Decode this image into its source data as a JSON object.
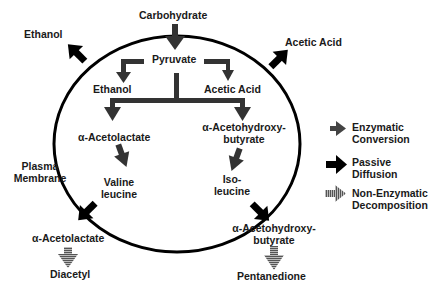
{
  "diagram": {
    "inputs": {
      "top": "Carbohydrate"
    },
    "inside_cell": {
      "pyruvate": "Pyruvate",
      "ethanol": "Ethanol",
      "acetic_acid": "Acetic Acid",
      "acetolactate": "α-Acetolactate",
      "acetohydroxy_line1": "α-Acetohydroxy-",
      "acetohydroxy_line2": "butyrate",
      "valine_line1": "Valine",
      "valine_line2": "leucine",
      "isoleucine_line1": "Iso-",
      "isoleucine_line2": "leucine"
    },
    "outside_cell": {
      "ethanol": "Ethanol",
      "acetic_acid": "Acetic Acid",
      "membrane_line1": "Plasma",
      "membrane_line2": "Membrane",
      "acetolactate": "α-Acetolactate",
      "diacetyl": "Diacetyl",
      "acetohydroxy_line1": "α-Acetohydroxy-",
      "acetohydroxy_line2": "butyrate",
      "pentanedione": "Pentanedione"
    },
    "legend": [
      {
        "icon": "enzymatic-arrow-icon",
        "line1": "Enzymatic",
        "line2": "Conversion",
        "color": "#333333"
      },
      {
        "icon": "passive-arrow-icon",
        "line1": "Passive",
        "line2": "Diffusion",
        "color": "#000000"
      },
      {
        "icon": "striped-arrow-icon",
        "line1": "Non-Enzymatic",
        "line2": "Decomposition",
        "color": "#777777"
      }
    ]
  }
}
